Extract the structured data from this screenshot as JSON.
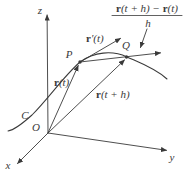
{
  "colors": {
    "ink": "#3a3a3a",
    "background": "#ffffff"
  },
  "axis_labels": {
    "x": "x",
    "y": "y",
    "z": "z"
  },
  "point_labels": {
    "origin": "O",
    "curve": "C",
    "p": "P",
    "q": "Q"
  },
  "vector_labels": {
    "r_t": {
      "vec": "r",
      "rest": "(t)"
    },
    "r_t_plus_h": {
      "vec": "r",
      "rest": "(t + h)"
    },
    "r_prime": {
      "vec": "r",
      "rest": "′(t)"
    }
  },
  "difference_quotient": {
    "numerator": {
      "vec1": "r",
      "mid": "(t + h) − ",
      "vec2": "r",
      "end": "(t)"
    },
    "denominator": "h"
  }
}
